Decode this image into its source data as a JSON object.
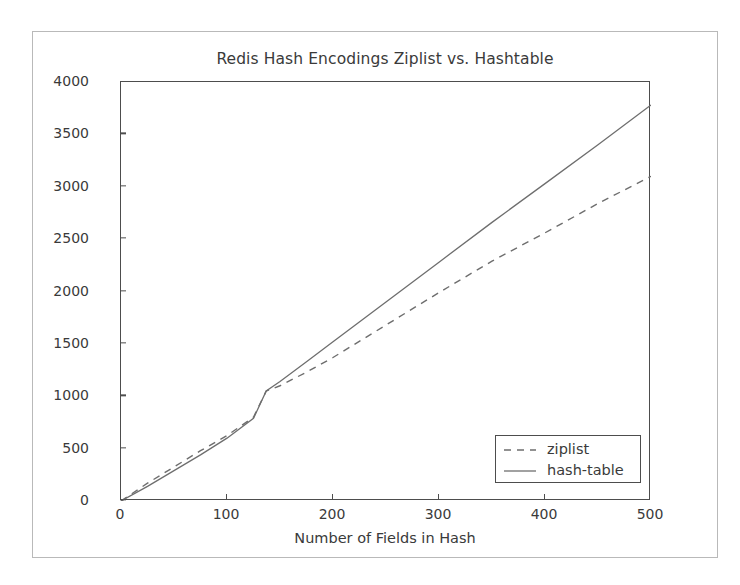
{
  "figure": {
    "title": "Redis Hash Encodings Ziplist vs. Hashtable",
    "background": "#ffffff",
    "frame_color": "#b9b9b9",
    "axis_color": "#4d4d4d",
    "text_color": "#3a3a3a"
  },
  "axes": {
    "xlabel": "Number of Fields in Hash",
    "ylabel": "Size of Hash in Bytes",
    "xticks": [
      "0",
      "100",
      "200",
      "300",
      "400",
      "500"
    ],
    "yticks": [
      "0",
      "500",
      "1000",
      "1500",
      "2000",
      "2500",
      "3000",
      "3500",
      "4000"
    ]
  },
  "legend": {
    "entries": [
      {
        "label": "ziplist",
        "style": "dashed",
        "color": "#6e6e6e"
      },
      {
        "label": "hash-table",
        "style": "solid",
        "color": "#6e6e6e"
      }
    ]
  },
  "chart_data": {
    "type": "line",
    "title": "Redis Hash Encodings Ziplist vs. Hashtable",
    "xlabel": "Number of Fields in Hash",
    "ylabel": "Size of Hash in Bytes",
    "xlim": [
      0,
      500
    ],
    "ylim": [
      0,
      4000
    ],
    "xticks": [
      0,
      100,
      200,
      300,
      400,
      500
    ],
    "yticks": [
      0,
      500,
      1000,
      1500,
      2000,
      2500,
      3000,
      3500,
      4000
    ],
    "grid": false,
    "legend_position": "lower right",
    "x": [
      0,
      25,
      50,
      75,
      100,
      125,
      137,
      150,
      175,
      200,
      250,
      300,
      350,
      400,
      450,
      500
    ],
    "series": [
      {
        "name": "ziplist",
        "style": "dashed",
        "values": [
          0,
          170,
          325,
          480,
          625,
          800,
          1050,
          1100,
          1230,
          1370,
          1680,
          1990,
          2290,
          2560,
          2840,
          3100
        ]
      },
      {
        "name": "hash-table",
        "style": "solid",
        "values": [
          0,
          140,
          290,
          440,
          600,
          790,
          1050,
          1140,
          1330,
          1520,
          1900,
          2280,
          2660,
          3030,
          3400,
          3780
        ]
      }
    ],
    "annotations": [
      "Lines cross near x = 137 fields (~1050 bytes); below the crossover ziplist is slightly larger, above it hash-table grows faster."
    ]
  }
}
